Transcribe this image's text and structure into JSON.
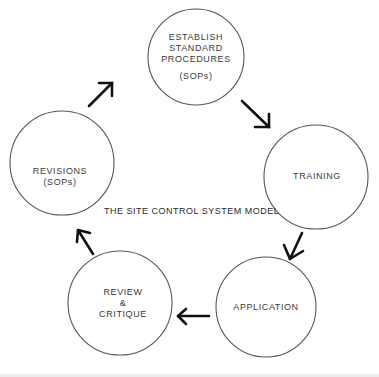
{
  "diagram": {
    "title": "THE SITE CONTROL SYSTEM MODEL",
    "type": "cycle",
    "nodes": [
      {
        "id": "establish",
        "lines": [
          "ESTABLISH",
          "STANDARD",
          "PROCEDURES",
          "",
          "(SOPs)"
        ],
        "cx": 196,
        "cy": 57,
        "r": 48
      },
      {
        "id": "training",
        "lines": [
          "TRAINING"
        ],
        "cx": 316,
        "cy": 177,
        "r": 52
      },
      {
        "id": "application",
        "lines": [
          "APPLICATION"
        ],
        "cx": 266,
        "cy": 307,
        "r": 50
      },
      {
        "id": "review",
        "lines": [
          "REVIEW",
          "&",
          "CRITIQUE"
        ],
        "cx": 120,
        "cy": 303,
        "r": 52
      },
      {
        "id": "revisions",
        "lines": [
          "REVISIONS",
          "(SOPs)"
        ],
        "cx": 62,
        "cy": 163,
        "r": 52
      }
    ],
    "edges": [
      {
        "from": "establish",
        "to": "training"
      },
      {
        "from": "training",
        "to": "application"
      },
      {
        "from": "application",
        "to": "review"
      },
      {
        "from": "review",
        "to": "revisions"
      },
      {
        "from": "revisions",
        "to": "establish"
      }
    ],
    "labels": {
      "establish_1": "ESTABLISH",
      "establish_2": "STANDARD",
      "establish_3": "PROCEDURES",
      "establish_4": "(SOPs)",
      "training": "TRAINING",
      "application": "APPLICATION",
      "review_1": "REVIEW",
      "review_2": "&",
      "review_3": "CRITIQUE",
      "revisions_1": "REVISIONS",
      "revisions_2": "(SOPs)"
    },
    "colors": {
      "circle_stroke": "#555555",
      "arrow": "#111111",
      "text": "#3a3a3a",
      "background": "#ffffff"
    }
  }
}
